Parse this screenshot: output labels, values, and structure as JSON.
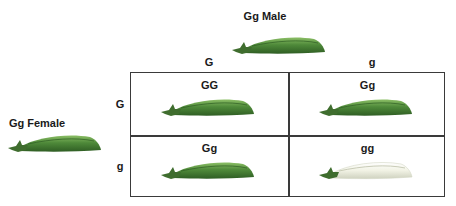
{
  "parents": {
    "male": {
      "label": "Gg Male",
      "pod_color": "green"
    },
    "female": {
      "label": "Gg Female",
      "pod_color": "green"
    }
  },
  "column_alleles": [
    "G",
    "g"
  ],
  "row_alleles": [
    "G",
    "g"
  ],
  "cells": [
    {
      "genotype": "GG",
      "pod_color": "green"
    },
    {
      "genotype": "Gg",
      "pod_color": "green"
    },
    {
      "genotype": "Gg",
      "pod_color": "green"
    },
    {
      "genotype": "gg",
      "pod_color": "yellow-white"
    }
  ],
  "colors": {
    "green_pod": "#4f8a3a",
    "green_pod_light": "#7fb25c",
    "green_pod_dark": "#2f5e24",
    "white_pod": "#f2f2e6",
    "white_pod_edge": "#cfd2c0",
    "calyx": "#3f6d2e",
    "grid_line": "#3a3a3a"
  }
}
